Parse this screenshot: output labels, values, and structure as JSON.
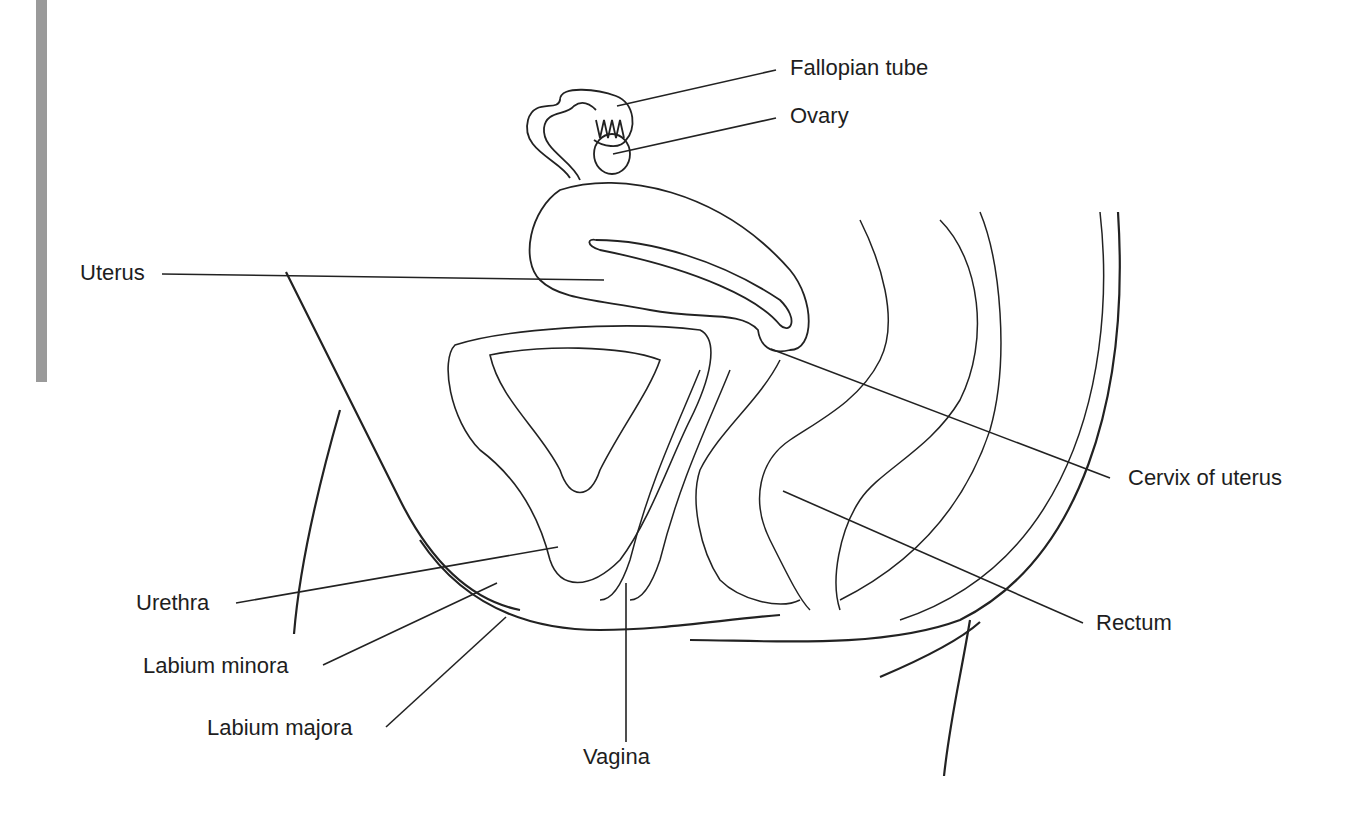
{
  "figure": {
    "type": "anatomical-diagram",
    "colors": {
      "line": "#222222",
      "text": "#1e1e1e",
      "side_bar": "#9a9a9a",
      "background": "#ffffff"
    }
  },
  "labels": {
    "fallopian_tube": "Fallopian tube",
    "ovary": "Ovary",
    "uterus": "Uterus",
    "cervix": "Cervix of uterus",
    "urethra": "Urethra",
    "labium_minora": "Labium minora",
    "labium_majora": "Labium majora",
    "vagina": "Vagina",
    "rectum": "Rectum"
  }
}
